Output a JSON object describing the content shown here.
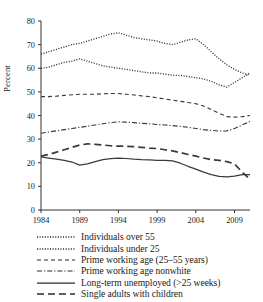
{
  "chart_data": {
    "type": "line",
    "title": "",
    "xlabel": "",
    "ylabel": "Percent",
    "xlim": [
      1984,
      2011
    ],
    "ylim": [
      0,
      80
    ],
    "ytick_step": 10,
    "yticks": [
      0,
      10,
      20,
      30,
      40,
      50,
      60,
      70,
      80
    ],
    "xticks": [
      1984,
      1989,
      1994,
      1999,
      2004,
      2009
    ],
    "xtick_labels": [
      "1984",
      "1989",
      "1994",
      "1999",
      "2004",
      "2009"
    ],
    "ytick_labels": [
      "0",
      "10",
      "20",
      "30",
      "40",
      "50",
      "60",
      "70",
      "80"
    ],
    "grid": false,
    "legend_position": "below",
    "x": [
      1984,
      1985,
      1986,
      1987,
      1988,
      1989,
      1990,
      1991,
      1992,
      1993,
      1994,
      1995,
      1996,
      1997,
      1998,
      1999,
      2000,
      2001,
      2002,
      2003,
      2004,
      2005,
      2006,
      2007,
      2008,
      2009,
      2010,
      2011
    ],
    "series": [
      {
        "name": "Individuals over 55",
        "style": "dotted",
        "values": [
          66,
          67,
          68,
          69,
          70,
          70.5,
          71.5,
          72.5,
          73.5,
          74.5,
          75,
          74,
          73,
          72.5,
          72,
          71.5,
          70.5,
          70,
          71,
          72,
          72.5,
          70,
          67,
          64,
          61.5,
          59.5,
          58,
          57
        ]
      },
      {
        "name": "Individuals under 25",
        "style": "dotted",
        "values": [
          60,
          60.5,
          61.5,
          62.5,
          63,
          64,
          63,
          62,
          61,
          60.5,
          60,
          59.5,
          59,
          58.5,
          58,
          58,
          57.5,
          57,
          57,
          56.5,
          56,
          55.5,
          54.5,
          53,
          52,
          54,
          56,
          58
        ]
      },
      {
        "name": "Prime working age (25–55 years)",
        "style": "dashed",
        "values": [
          48,
          48,
          48.2,
          48.5,
          48.8,
          49,
          49,
          49,
          49.2,
          49.3,
          49.3,
          49,
          48.7,
          48.3,
          48,
          47.5,
          47,
          46.5,
          46,
          45.5,
          45,
          44,
          42.5,
          41,
          39.5,
          39.3,
          39.5,
          40
        ]
      },
      {
        "name": "Prime working age nonwhite",
        "style": "dashdot",
        "values": [
          32.5,
          33,
          33.5,
          34,
          34.5,
          35,
          35.5,
          36,
          36.5,
          37,
          37.3,
          37.2,
          37,
          36.7,
          36.5,
          36.2,
          36,
          35.7,
          35.4,
          35,
          34.5,
          34,
          33.7,
          33.4,
          33.5,
          34.5,
          36,
          37.5
        ]
      },
      {
        "name": "Long-term unemployed (>25 weeks)",
        "style": "solid",
        "values": [
          22.5,
          22,
          21.5,
          21,
          20.3,
          19,
          19.5,
          20.5,
          21.3,
          21.7,
          22,
          21.8,
          21.5,
          21.3,
          21.2,
          21,
          21,
          20.8,
          19.8,
          18.5,
          17.3,
          16,
          15,
          14.2,
          14,
          14.3,
          15,
          15
        ]
      },
      {
        "name": "Single adults with children",
        "style": "longdash",
        "values": [
          22.8,
          23.5,
          24.5,
          25.5,
          26.5,
          27.5,
          28,
          27.8,
          27.5,
          27.2,
          27,
          27,
          26.8,
          26.5,
          26.2,
          26,
          25.5,
          25,
          24.3,
          23.5,
          22.8,
          22,
          21.3,
          21,
          20.5,
          19.5,
          16,
          13
        ]
      }
    ]
  },
  "legend": {
    "items": [
      {
        "label": "Individuals over 55",
        "style": "dotted"
      },
      {
        "label": "Individuals under 25",
        "style": "dotted"
      },
      {
        "label": "Prime working age (25–55 years)",
        "style": "dashed"
      },
      {
        "label": "Prime working age nonwhite",
        "style": "dashdot"
      },
      {
        "label": "Long-term unemployed (>25 weeks)",
        "style": "solid"
      },
      {
        "label": "Single adults with children",
        "style": "longdash"
      }
    ]
  }
}
